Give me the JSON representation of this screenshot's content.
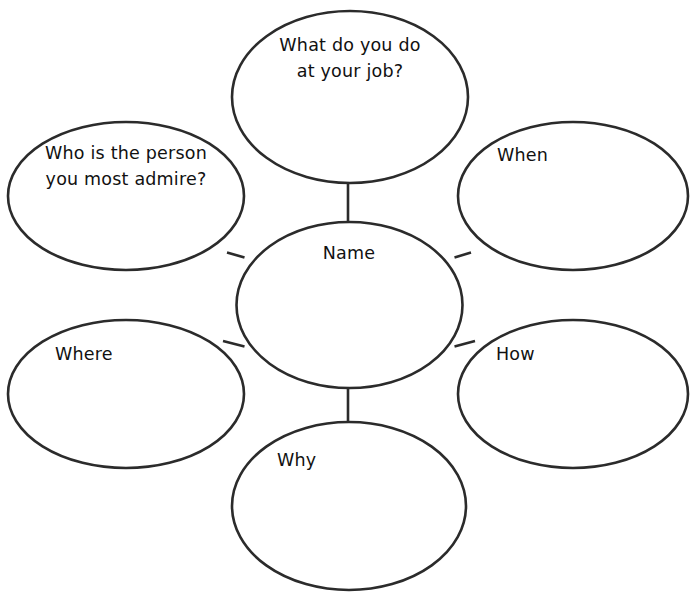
{
  "diagram": {
    "type": "concept-web",
    "title": "Name",
    "stroke_color": "#2b2b2b",
    "fill_color": "#ffffff",
    "text_color": "#111111",
    "center": {
      "id": "center",
      "label": "Name",
      "cx": 349.5,
      "cy": 305,
      "rx": 113,
      "ry": 83,
      "text_x": 349,
      "text_y": 259,
      "text_anchor": "middle",
      "lines": [
        "Name"
      ]
    },
    "bubbles": [
      {
        "id": "top",
        "label": "What do you do at your job?",
        "cx": 350,
        "cy": 97,
        "rx": 118,
        "ry": 86,
        "text_x": 350,
        "text_y": 51,
        "text_anchor": "middle",
        "line_height": 26,
        "lines": [
          "What do you do",
          "at your job?"
        ]
      },
      {
        "id": "upper-left",
        "label": "Who is the person you most admire?",
        "cx": 126,
        "cy": 196,
        "rx": 118,
        "ry": 74,
        "text_x": 126,
        "text_y": 159,
        "text_anchor": "middle",
        "line_height": 26,
        "lines": [
          "Who is the person",
          "you most admire?"
        ]
      },
      {
        "id": "upper-right",
        "label": "When",
        "cx": 573,
        "cy": 196,
        "rx": 115,
        "ry": 74,
        "text_x": 497,
        "text_y": 161,
        "text_anchor": "start",
        "line_height": 26,
        "lines": [
          "When"
        ]
      },
      {
        "id": "lower-left",
        "label": "Where",
        "cx": 126,
        "cy": 394,
        "rx": 118,
        "ry": 74,
        "text_x": 55,
        "text_y": 360,
        "text_anchor": "start",
        "line_height": 26,
        "lines": [
          "Where"
        ]
      },
      {
        "id": "lower-right",
        "label": "How",
        "cx": 573,
        "cy": 394,
        "rx": 115,
        "ry": 74,
        "text_x": 496,
        "text_y": 360,
        "text_anchor": "start",
        "line_height": 26,
        "lines": [
          "How"
        ]
      },
      {
        "id": "bottom",
        "label": "Why",
        "cx": 349,
        "cy": 506,
        "rx": 117,
        "ry": 84,
        "text_x": 277,
        "text_y": 466,
        "text_anchor": "start",
        "line_height": 26,
        "lines": [
          "Why"
        ]
      }
    ],
    "connectors": [
      {
        "id": "center-to-top",
        "x1": 348,
        "y1": 222,
        "x2": 348,
        "y2": 183
      },
      {
        "id": "center-to-upper-left",
        "x1": 244.5,
        "y1": 257.5,
        "x2": 227,
        "y2": 252.5
      },
      {
        "id": "center-to-upper-right",
        "x1": 454.5,
        "y1": 257.5,
        "x2": 471,
        "y2": 252.5
      },
      {
        "id": "center-to-lower-left",
        "x1": 244.5,
        "y1": 346.5,
        "x2": 223,
        "y2": 341
      },
      {
        "id": "center-to-lower-right",
        "x1": 454.5,
        "y1": 346.5,
        "x2": 475,
        "y2": 341
      },
      {
        "id": "center-to-bottom",
        "x1": 348,
        "y1": 388,
        "x2": 348,
        "y2": 423
      }
    ]
  }
}
